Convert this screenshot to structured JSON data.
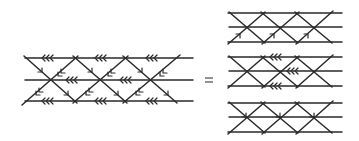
{
  "figure": {
    "equals_sign": "=",
    "line_color": "#2a2a2a",
    "lhs": {
      "label": "combined-strip",
      "arrows": "triple chevrons pointing left on horizontal lines; double chevrons along descending diagonals"
    },
    "rhs": [
      {
        "label": "strip-1",
        "arrows": "single arrowheads on up-right diagonals"
      },
      {
        "label": "strip-2",
        "arrows": "triple chevrons pointing left on horizontal lines"
      },
      {
        "label": "strip-3",
        "arrows": "single arrowheads on down-right diagonals at middle crossings"
      }
    ]
  }
}
